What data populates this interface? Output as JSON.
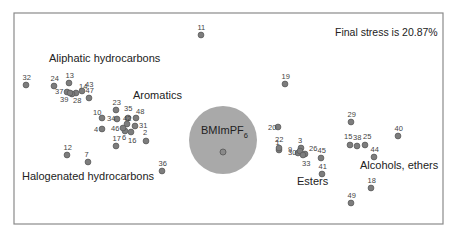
{
  "chart_data": {
    "type": "scatter",
    "title": "",
    "xlabel": "",
    "ylabel": "",
    "grid": false,
    "annotation": "Final stress is 20.87%",
    "colors": {
      "point": "#7d7d7d",
      "bubble": "#a9a9a9",
      "frame": "#8a8a8a"
    },
    "reference": {
      "label": "BMImPF",
      "subscript": "6",
      "x": 223,
      "y": 152,
      "radius": 34
    },
    "group_labels": [
      {
        "text": "Aliphatic hydrocarbons",
        "x": 49,
        "y": 62
      },
      {
        "text": "Aromatics",
        "x": 133,
        "y": 99
      },
      {
        "text": "Halogenated hydrocarbons",
        "x": 22,
        "y": 180
      },
      {
        "text": "Esters",
        "x": 297,
        "y": 185
      },
      {
        "text": "Alcohols, ethers",
        "x": 360,
        "y": 169
      }
    ],
    "points": [
      {
        "id": "1",
        "x": 279,
        "y": 150
      },
      {
        "id": "2",
        "x": 146,
        "y": 141
      },
      {
        "id": "3",
        "x": 301,
        "y": 148
      },
      {
        "id": "4",
        "x": 102,
        "y": 129
      },
      {
        "id": "6",
        "x": 125,
        "y": 131
      },
      {
        "id": "7",
        "x": 88,
        "y": 162
      },
      {
        "id": "9",
        "x": 298,
        "y": 153
      },
      {
        "id": "10",
        "x": 102,
        "y": 118
      },
      {
        "id": "11",
        "x": 201,
        "y": 35
      },
      {
        "id": "12",
        "x": 67,
        "y": 155
      },
      {
        "id": "13",
        "x": 69,
        "y": 83
      },
      {
        "id": "14",
        "x": 76,
        "y": 93
      },
      {
        "id": "15",
        "x": 350,
        "y": 145
      },
      {
        "id": "16",
        "x": 131,
        "y": 132
      },
      {
        "id": "17",
        "x": 116,
        "y": 146
      },
      {
        "id": "18",
        "x": 371,
        "y": 188
      },
      {
        "id": "19",
        "x": 285,
        "y": 84
      },
      {
        "id": "20",
        "x": 278,
        "y": 127
      },
      {
        "id": "22",
        "x": 279,
        "y": 148
      },
      {
        "id": "23",
        "x": 116,
        "y": 110
      },
      {
        "id": "24",
        "x": 54,
        "y": 86
      },
      {
        "id": "25",
        "x": 365,
        "y": 145
      },
      {
        "id": "26",
        "x": 305,
        "y": 154
      },
      {
        "id": "28",
        "x": 72,
        "y": 94
      },
      {
        "id": "29",
        "x": 351,
        "y": 122
      },
      {
        "id": "30",
        "x": 300,
        "y": 151
      },
      {
        "id": "31",
        "x": 135,
        "y": 126
      },
      {
        "id": "32",
        "x": 26,
        "y": 85
      },
      {
        "id": "33",
        "x": 303,
        "y": 155
      },
      {
        "id": "34",
        "x": 117,
        "y": 119
      },
      {
        "id": "35",
        "x": 128,
        "y": 118
      },
      {
        "id": "36",
        "x": 162,
        "y": 171
      },
      {
        "id": "37",
        "x": 67,
        "y": 92
      },
      {
        "id": "38",
        "x": 357,
        "y": 146
      },
      {
        "id": "39",
        "x": 70,
        "y": 93
      },
      {
        "id": "40",
        "x": 398,
        "y": 136
      },
      {
        "id": "41",
        "x": 322,
        "y": 174
      },
      {
        "id": "42",
        "x": 127,
        "y": 124
      },
      {
        "id": "43",
        "x": 82,
        "y": 91
      },
      {
        "id": "44",
        "x": 374,
        "y": 157
      },
      {
        "id": "45",
        "x": 321,
        "y": 158
      },
      {
        "id": "46",
        "x": 123,
        "y": 128
      },
      {
        "id": "47",
        "x": 89,
        "y": 98
      },
      {
        "id": "48",
        "x": 136,
        "y": 118
      },
      {
        "id": "49",
        "x": 351,
        "y": 203
      }
    ]
  }
}
